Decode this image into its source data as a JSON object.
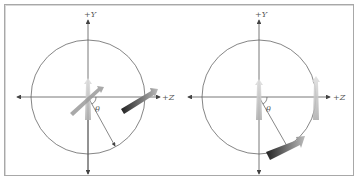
{
  "figure": {
    "panels": [
      {
        "id": "left",
        "labels": {
          "y_axis": "+Y",
          "z_axis": "+Z",
          "angle": "θ"
        },
        "description": "Two arrow glyphs: one at the origin (pointing up and toward +Z, partially), one on the circle at +Z pointing along +Z"
      },
      {
        "id": "right",
        "labels": {
          "y_axis": "+Y",
          "z_axis": "+Z",
          "angle": "θ"
        },
        "description": "Upright arrow at origin, upright arrow on circle at +Z, and a rotated arrow on the circle at angle θ below +Z"
      }
    ],
    "colors": {
      "frame": "#a8a8a8",
      "axis": "#555555",
      "circle": "#666666",
      "arrow_light": "#c8c8c8",
      "arrow_dark": "#333333"
    }
  }
}
